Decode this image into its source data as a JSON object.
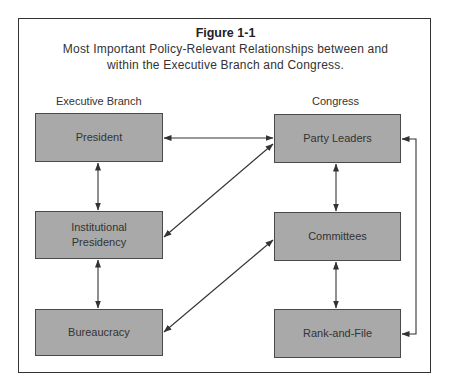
{
  "figure": {
    "label": "Figure 1-1",
    "caption_line1": "Most Important Policy-Relevant Relationships between and",
    "caption_line2": "within the Executive Branch and Congress."
  },
  "columns": {
    "left_header": "Executive Branch",
    "right_header": "Congress"
  },
  "nodes": {
    "president": "President",
    "institutional_presidency_line1": "Institutional",
    "institutional_presidency_line2": "Presidency",
    "bureaucracy": "Bureaucracy",
    "party_leaders": "Party Leaders",
    "committees": "Committees",
    "rank_and_file": "Rank-and-File"
  },
  "edges": [
    {
      "from": "President",
      "to": "Party Leaders",
      "type": "bidirectional"
    },
    {
      "from": "President",
      "to": "Institutional Presidency",
      "type": "bidirectional"
    },
    {
      "from": "Institutional Presidency",
      "to": "Bureaucracy",
      "type": "bidirectional"
    },
    {
      "from": "Institutional Presidency",
      "to": "Party Leaders",
      "type": "bidirectional"
    },
    {
      "from": "Bureaucracy",
      "to": "Committees",
      "type": "bidirectional"
    },
    {
      "from": "Party Leaders",
      "to": "Committees",
      "type": "bidirectional"
    },
    {
      "from": "Committees",
      "to": "Rank-and-File",
      "type": "bidirectional"
    },
    {
      "from": "Party Leaders",
      "to": "Rank-and-File",
      "type": "bidirectional"
    }
  ],
  "colors": {
    "box_fill": "#a9a9a9",
    "line": "#333333"
  }
}
